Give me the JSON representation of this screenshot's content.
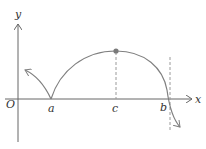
{
  "diagram": {
    "type": "function-graph-sketch",
    "colors": {
      "axis": "#666666",
      "curve": "#808080",
      "dashed": "#9a9a9a",
      "point": "#7a7a7a",
      "text": "#333333"
    },
    "axes": {
      "x_label": "x",
      "y_label": "y",
      "origin_label": "O"
    },
    "points": {
      "a_label": "a",
      "c_label": "c",
      "b_label": "b"
    },
    "features": [
      "cusp at x=a on x-axis",
      "local maximum at x=c (marked dot)",
      "vertical tangent crossing at x=b",
      "dashed vertical line at x=c",
      "dashed vertical asymptote-like line near x=b"
    ]
  }
}
